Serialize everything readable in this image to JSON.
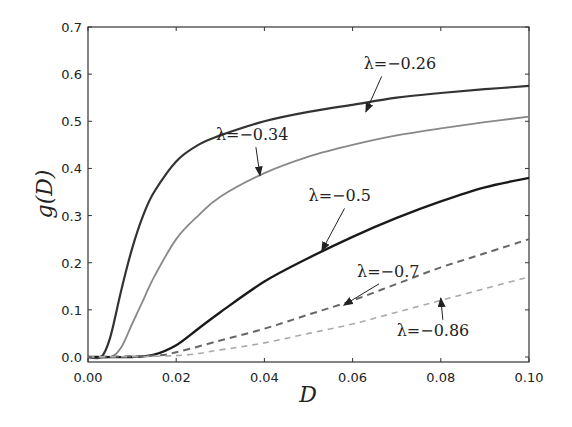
{
  "chart_data": {
    "type": "line",
    "title": "",
    "xlabel": "D",
    "ylabel": "g(D)",
    "xlim": [
      0.0,
      0.1
    ],
    "ylim": [
      0.0,
      0.7
    ],
    "xticks": [
      "0.00",
      "0.02",
      "0.04",
      "0.06",
      "0.08",
      "0.10"
    ],
    "yticks": [
      "0.0",
      "0.1",
      "0.2",
      "0.3",
      "0.4",
      "0.5",
      "0.6",
      "0.7"
    ],
    "grid": false,
    "legend": "none (inline annotations with arrows)",
    "series": [
      {
        "name": "λ = −0.26",
        "label": "λ=−0.26",
        "color": "#333333",
        "width": 2.2,
        "dash": "",
        "x": [
          0.0,
          0.003,
          0.005,
          0.0075,
          0.01,
          0.0125,
          0.015,
          0.02,
          0.025,
          0.03,
          0.04,
          0.05,
          0.06,
          0.07,
          0.08,
          0.09,
          0.1
        ],
        "y": [
          0.0,
          0.0,
          0.04,
          0.14,
          0.23,
          0.3,
          0.35,
          0.415,
          0.45,
          0.47,
          0.5,
          0.52,
          0.535,
          0.55,
          0.56,
          0.568,
          0.575
        ]
      },
      {
        "name": "λ = −0.34",
        "label": "λ=−0.34",
        "color": "#888888",
        "width": 1.8,
        "dash": "",
        "x": [
          0.0,
          0.005,
          0.0075,
          0.01,
          0.0125,
          0.015,
          0.02,
          0.025,
          0.03,
          0.04,
          0.05,
          0.06,
          0.07,
          0.08,
          0.09,
          0.1
        ],
        "y": [
          0.0,
          0.0,
          0.02,
          0.07,
          0.12,
          0.17,
          0.25,
          0.3,
          0.34,
          0.39,
          0.425,
          0.45,
          0.47,
          0.485,
          0.498,
          0.51
        ],
        "label_anchor": [
          0.04,
          0.395
        ]
      },
      {
        "name": "λ = −0.5",
        "label": "λ=−0.5",
        "color": "#1a1a1a",
        "width": 2.4,
        "dash": "",
        "x": [
          0.0,
          0.01,
          0.015,
          0.02,
          0.025,
          0.03,
          0.04,
          0.05,
          0.06,
          0.07,
          0.08,
          0.09,
          0.1
        ],
        "y": [
          0.0,
          0.0,
          0.005,
          0.025,
          0.06,
          0.095,
          0.16,
          0.21,
          0.255,
          0.295,
          0.33,
          0.36,
          0.38
        ]
      },
      {
        "name": "λ = −0.7",
        "label": "λ=−0.7",
        "color": "#666666",
        "width": 2.0,
        "dash": "7,5",
        "x": [
          0.0,
          0.015,
          0.02,
          0.03,
          0.04,
          0.05,
          0.06,
          0.07,
          0.08,
          0.09,
          0.1
        ],
        "y": [
          0.0,
          0.003,
          0.01,
          0.035,
          0.06,
          0.09,
          0.12,
          0.155,
          0.19,
          0.22,
          0.25
        ]
      },
      {
        "name": "λ = −0.86",
        "label": "λ=−0.86",
        "color": "#aaaaaa",
        "width": 1.6,
        "dash": "6,5",
        "x": [
          0.0,
          0.02,
          0.03,
          0.04,
          0.05,
          0.06,
          0.07,
          0.08,
          0.09,
          0.1
        ],
        "y": [
          0.0,
          0.003,
          0.015,
          0.03,
          0.05,
          0.07,
          0.095,
          0.12,
          0.145,
          0.17
        ]
      }
    ],
    "annotations": [
      {
        "text": "λ=−0.26",
        "text_xy": [
          0.0625,
          0.61
        ],
        "arrow_to": [
          0.063,
          0.52
        ]
      },
      {
        "text": "λ=−0.34",
        "text_xy": [
          0.029,
          0.46
        ],
        "arrow_to": [
          0.039,
          0.385
        ]
      },
      {
        "text": "λ=−0.5",
        "text_xy": [
          0.05,
          0.33
        ],
        "arrow_to": [
          0.053,
          0.225
        ]
      },
      {
        "text": "λ=−0.7",
        "text_xy": [
          0.061,
          0.17
        ],
        "arrow_to": [
          0.058,
          0.11
        ]
      },
      {
        "text": "λ=−0.86",
        "text_xy": [
          0.07,
          0.045
        ],
        "arrow_to": [
          0.08,
          0.125
        ]
      }
    ]
  },
  "axes": {
    "x_label": "D",
    "y_label": "g(D)"
  }
}
